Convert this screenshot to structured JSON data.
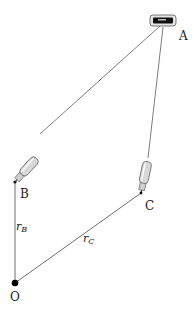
{
  "diagram": {
    "points": {
      "A": {
        "label": "A",
        "x": 162,
        "y": 22
      },
      "B": {
        "label": "B",
        "x": 15,
        "y": 182
      },
      "C": {
        "label": "C",
        "x": 141,
        "y": 193
      },
      "O": {
        "label": "O",
        "x": 15,
        "y": 283
      }
    },
    "vectors": {
      "rB": {
        "symbol": "r",
        "subscript": "B"
      },
      "rC": {
        "symbol": "r",
        "subscript": "C"
      }
    },
    "colors": {
      "line": "#6e6e6e",
      "dot": "#000000",
      "probe_body": "#d8d8d8",
      "probe_outline": "#555555",
      "device_screen": "#111111"
    }
  }
}
